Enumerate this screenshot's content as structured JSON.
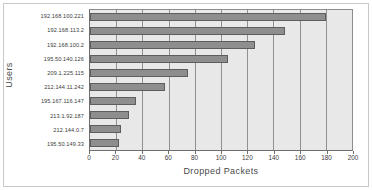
{
  "chart_data": {
    "type": "bar",
    "orientation": "horizontal",
    "title": "",
    "xlabel": "Dropped Packets",
    "ylabel": "Users",
    "xlim": [
      0,
      200
    ],
    "xticks": [
      0,
      20,
      40,
      60,
      80,
      100,
      120,
      140,
      160,
      180,
      200
    ],
    "grid": true,
    "legend": false,
    "categories": [
      "192.168.100.221",
      "192.168.113.2",
      "192.168.100.2",
      "195.50.140.126",
      "209.1.225.115",
      "212.144.11.242",
      "195.167.116.147",
      "213.1.92.187",
      "212.144.0.7",
      "195.50.149.33"
    ],
    "values": [
      180,
      149,
      126,
      105,
      75,
      57,
      35,
      30,
      24,
      22
    ],
    "colors": {
      "bar_fill": "#8e8e8e",
      "bar_border": "#5d5d5d",
      "plot_background": "#e8e8e8",
      "gridline": "#909090",
      "axis": "#6e6e6e",
      "text": "#3c3c3c",
      "figure_border": "#c9c9c9"
    }
  }
}
